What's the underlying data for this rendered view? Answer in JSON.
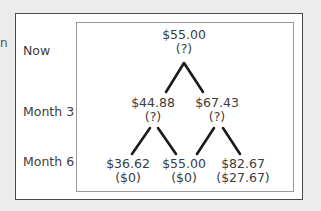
{
  "edge_fragment": "n",
  "periods": [
    {
      "label": "Now"
    },
    {
      "label": "Month 3"
    },
    {
      "label": "Month 6"
    }
  ],
  "tree": {
    "root": {
      "price": "$55.00",
      "value": "(?)"
    },
    "month3": [
      {
        "price": "$44.88",
        "value": "(?)"
      },
      {
        "price": "$67.43",
        "value": "(?)"
      }
    ],
    "month6": [
      {
        "price": "$36.62",
        "value": "($0)"
      },
      {
        "price": "$55.00",
        "value": "($0)"
      },
      {
        "price": "$82.67",
        "value": "($27.67)"
      }
    ]
  },
  "colors": {
    "background": "#ececec",
    "box": "#ffffff",
    "lines": "#1a1a1a"
  }
}
